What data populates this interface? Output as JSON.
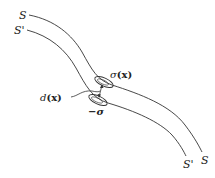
{
  "diagram": {
    "surfaces": [
      {
        "name": "S",
        "label_top": "S",
        "label_bottom": "S"
      },
      {
        "name": "S-prime",
        "label_top": "S'",
        "label_bottom": "S'"
      }
    ],
    "annotations": {
      "sigma_x": {
        "symbol": "σ",
        "arg": "(x)"
      },
      "minus_sigma": "−σ",
      "d_x": {
        "symbol": "d",
        "arg": "(x)"
      }
    },
    "colors": {
      "line": "#333333",
      "background": "#ffffff"
    }
  }
}
